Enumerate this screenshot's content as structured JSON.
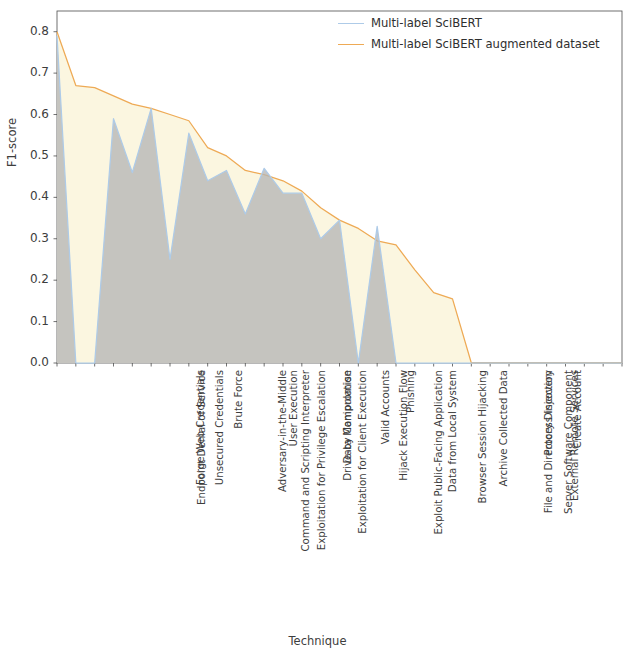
{
  "chart_data": {
    "type": "area",
    "title": "",
    "xlabel": "Technique",
    "ylabel": "F1-score",
    "ylim": [
      0.0,
      0.85
    ],
    "yticks": [
      0.0,
      0.1,
      0.2,
      0.3,
      0.4,
      0.5,
      0.6,
      0.7,
      0.8
    ],
    "ytick_labels": [
      "0.0",
      "0.1",
      "0.2",
      "0.3",
      "0.4",
      "0.5",
      "0.6",
      "0.7",
      "0.8"
    ],
    "grid": false,
    "legend_position": "top-right",
    "categories": [
      "Endpoint Denial of Service",
      "Forge Web Credentials",
      "Unsecured Credentials",
      "Command and Scripting Interpreter",
      "Exploitation for Privilege Escalation",
      "Adversary-in-the-Middle",
      "Brute Force",
      "Exploitation for Client Execution",
      "User Execution",
      "Drive-by Compromise",
      "Data Manipulation",
      "Exploit Public-Facing Application",
      "Hijack Execution Flow",
      "Valid Accounts",
      "Data from Local System",
      "Browser Session Hijacking",
      "Phishing",
      "Archive Collected Data",
      "File and Directory Discovery",
      "Server Software Component",
      "External Remote Services",
      "Process Injection",
      "Exploitation for Defense Evasion",
      "Create Account",
      "Access Token Manipulation",
      "Exploitation of Remote Services",
      "Stage Capabilities",
      "Abuse Elevation Control Mechanism",
      "Exploitation for Credential Access",
      "Data Destruction",
      "Network Sniffing"
    ],
    "series": [
      {
        "name": "Multi-label SciBERT",
        "color": "#aecbe8",
        "fill": "#b6b6b6",
        "values": [
          0.79,
          0.0,
          0.0,
          0.59,
          0.46,
          0.615,
          0.25,
          0.555,
          0.44,
          0.465,
          0.36,
          0.47,
          0.41,
          0.41,
          0.3,
          0.345,
          0.0,
          0.33,
          0.0,
          0.0,
          0.0,
          0.0,
          0.0,
          0.0,
          0.0,
          0.0,
          0.0,
          0.0,
          0.0,
          0.0,
          0.0
        ]
      },
      {
        "name": "Multi-label SciBERT augmented dataset",
        "color": "#eeaa55",
        "fill": "#fbf6e0",
        "values": [
          0.8,
          0.67,
          0.665,
          0.645,
          0.625,
          0.615,
          0.6,
          0.585,
          0.52,
          0.5,
          0.465,
          0.455,
          0.44,
          0.415,
          0.375,
          0.345,
          0.325,
          0.295,
          0.285,
          0.225,
          0.17,
          0.155,
          0.0,
          0.0,
          0.0,
          0.0,
          0.0,
          0.0,
          0.0,
          0.0,
          0.0
        ]
      }
    ]
  },
  "legend": {
    "entries": [
      {
        "label": "Multi-label SciBERT",
        "color": "#aecbe8"
      },
      {
        "label": "Multi-label SciBERT augmented dataset",
        "color": "#eeaa55"
      }
    ]
  },
  "axes": {
    "x_title": "Technique",
    "y_title": "F1-score"
  }
}
